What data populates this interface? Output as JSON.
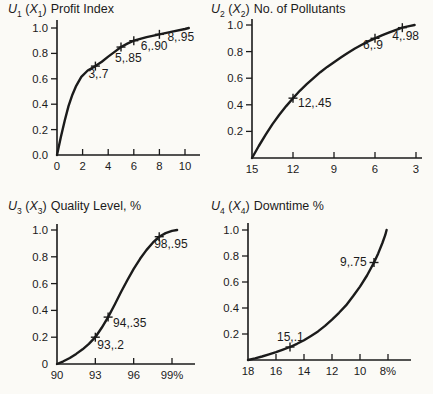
{
  "figure_title": "Utility functions for four attributes",
  "chart_data": [
    {
      "id": "u1",
      "type": "line",
      "title": {
        "func": "U",
        "func_sub": "1",
        "lparen": "(",
        "arg": "X",
        "arg_sub": "1",
        "rparen": ")",
        "label": "Profit Index"
      },
      "x_range": [
        0,
        10
      ],
      "y_range": [
        0,
        1
      ],
      "x_ticks": [
        0,
        2,
        4,
        6,
        8,
        10
      ],
      "x_tick_labels": [
        "0",
        "2",
        "4",
        "6",
        "8",
        "10"
      ],
      "y_ticks": [
        0,
        0.2,
        0.4,
        0.6,
        0.8,
        1.0
      ],
      "y_tick_labels": [
        "0.0",
        "0.2",
        "0.4",
        "0.6",
        "0.8",
        "1.0"
      ],
      "curve": [
        [
          0,
          0
        ],
        [
          0.3,
          0.14
        ],
        [
          0.6,
          0.27
        ],
        [
          0.9,
          0.385
        ],
        [
          1.2,
          0.475
        ],
        [
          1.5,
          0.545
        ],
        [
          1.9,
          0.615
        ],
        [
          2.4,
          0.665
        ],
        [
          3,
          0.7
        ],
        [
          3.5,
          0.735
        ],
        [
          4,
          0.775
        ],
        [
          4.5,
          0.812
        ],
        [
          5,
          0.85
        ],
        [
          5.5,
          0.877
        ],
        [
          6,
          0.9
        ],
        [
          7,
          0.928
        ],
        [
          8,
          0.95
        ],
        [
          9,
          0.972
        ],
        [
          10,
          0.992
        ],
        [
          10.3,
          1.0
        ]
      ],
      "points": [
        {
          "x": 3,
          "y": 0.7,
          "label": "3,.7",
          "dx": -7,
          "dy": 12
        },
        {
          "x": 5,
          "y": 0.85,
          "label": "5,.85",
          "dx": -6,
          "dy": 15
        },
        {
          "x": 6,
          "y": 0.9,
          "label": "6,.90",
          "dx": 7,
          "dy": 9
        },
        {
          "x": 8,
          "y": 0.95,
          "label": "8,.95",
          "dx": 8,
          "dy": 7
        }
      ]
    },
    {
      "id": "u2",
      "type": "line",
      "title": {
        "func": "U",
        "func_sub": "2",
        "lparen": "(",
        "arg": "X",
        "arg_sub": "2",
        "rparen": ")",
        "label": "No. of Pollutants"
      },
      "x_range": [
        15,
        3
      ],
      "y_range": [
        0,
        1
      ],
      "x_ticks": [
        15,
        12,
        9,
        6,
        3
      ],
      "x_tick_labels": [
        "15",
        "12",
        "9",
        "6",
        "3"
      ],
      "y_ticks": [
        0.2,
        0.4,
        0.6,
        0.8,
        1.0
      ],
      "y_tick_labels": [
        "0.2",
        "0.4",
        "0.6",
        "0.8",
        "1.0"
      ],
      "curve": [
        [
          15,
          0
        ],
        [
          14.5,
          0.09
        ],
        [
          14,
          0.175
        ],
        [
          13.5,
          0.255
        ],
        [
          13,
          0.325
        ],
        [
          12.5,
          0.39
        ],
        [
          12,
          0.45
        ],
        [
          11.5,
          0.505
        ],
        [
          11,
          0.555
        ],
        [
          10.5,
          0.6
        ],
        [
          10,
          0.645
        ],
        [
          9.5,
          0.685
        ],
        [
          9,
          0.72
        ],
        [
          8.5,
          0.755
        ],
        [
          8,
          0.79
        ],
        [
          7.5,
          0.822
        ],
        [
          7,
          0.85
        ],
        [
          6.5,
          0.877
        ],
        [
          6,
          0.9
        ],
        [
          5.5,
          0.922
        ],
        [
          5,
          0.942
        ],
        [
          4.5,
          0.962
        ],
        [
          4,
          0.98
        ],
        [
          3.5,
          0.992
        ],
        [
          3.1,
          1.0
        ]
      ],
      "points": [
        {
          "x": 12,
          "y": 0.45,
          "label": "12,.45",
          "dx": 5,
          "dy": 9
        },
        {
          "x": 6,
          "y": 0.9,
          "label": "6,.9",
          "dx": -12,
          "dy": 11
        },
        {
          "x": 4,
          "y": 0.98,
          "label": "4,.98",
          "dx": -10,
          "dy": 12
        }
      ]
    },
    {
      "id": "u3",
      "type": "line",
      "title": {
        "func": "U",
        "func_sub": "3",
        "lparen": "(",
        "arg": "X",
        "arg_sub": "3",
        "rparen": ")",
        "label": "Quality Level, %"
      },
      "x_range": [
        90,
        99
      ],
      "y_range": [
        0,
        1
      ],
      "x_ticks": [
        90,
        93,
        96,
        99
      ],
      "x_tick_labels": [
        "90",
        "93",
        "96",
        "99%"
      ],
      "y_ticks": [
        0,
        0.2,
        0.4,
        0.6,
        0.8,
        1.0
      ],
      "y_tick_labels": [
        "0",
        "0.2",
        "0.4",
        "0.6",
        "0.8",
        "1.0"
      ],
      "curve": [
        [
          90,
          0
        ],
        [
          90.5,
          0.02
        ],
        [
          91,
          0.045
        ],
        [
          91.5,
          0.075
        ],
        [
          92,
          0.11
        ],
        [
          92.5,
          0.15
        ],
        [
          93,
          0.2
        ],
        [
          93.5,
          0.27
        ],
        [
          94,
          0.35
        ],
        [
          94.5,
          0.44
        ],
        [
          95,
          0.535
        ],
        [
          95.5,
          0.625
        ],
        [
          96,
          0.71
        ],
        [
          96.5,
          0.785
        ],
        [
          97,
          0.85
        ],
        [
          97.5,
          0.905
        ],
        [
          98,
          0.95
        ],
        [
          98.5,
          0.977
        ],
        [
          99,
          0.993
        ],
        [
          99.4,
          1.0
        ]
      ],
      "points": [
        {
          "x": 93,
          "y": 0.2,
          "label": "93,.2",
          "dx": 2,
          "dy": 12
        },
        {
          "x": 94,
          "y": 0.35,
          "label": "94,.35",
          "dx": 5,
          "dy": 10
        },
        {
          "x": 98,
          "y": 0.95,
          "label": "98,.95",
          "dx": -5,
          "dy": 11
        }
      ]
    },
    {
      "id": "u4",
      "type": "line",
      "title": {
        "func": "U",
        "func_sub": "4",
        "lparen": "(",
        "arg": "X",
        "arg_sub": "4",
        "rparen": ")",
        "label": "Downtime %"
      },
      "x_range": [
        18,
        8
      ],
      "y_range": [
        0,
        1
      ],
      "x_ticks": [
        18,
        16,
        14,
        12,
        10,
        8
      ],
      "x_tick_labels": [
        "18",
        "16",
        "14",
        "12",
        "10",
        "8%"
      ],
      "y_ticks": [
        0.2,
        0.4,
        0.6,
        0.8,
        1.0
      ],
      "y_tick_labels": [
        "0.2",
        "0.4",
        "0.6",
        "0.8",
        "1.0"
      ],
      "curve": [
        [
          18,
          0
        ],
        [
          17.5,
          0.012
        ],
        [
          17,
          0.027
        ],
        [
          16.5,
          0.043
        ],
        [
          16,
          0.06
        ],
        [
          15.5,
          0.08
        ],
        [
          15,
          0.1
        ],
        [
          14.5,
          0.125
        ],
        [
          14,
          0.152
        ],
        [
          13.5,
          0.185
        ],
        [
          13,
          0.22
        ],
        [
          12.5,
          0.262
        ],
        [
          12,
          0.31
        ],
        [
          11.5,
          0.363
        ],
        [
          11,
          0.42
        ],
        [
          10.5,
          0.49
        ],
        [
          10,
          0.565
        ],
        [
          9.5,
          0.65
        ],
        [
          9,
          0.75
        ],
        [
          8.7,
          0.82
        ],
        [
          8.4,
          0.9
        ],
        [
          8.2,
          0.96
        ],
        [
          8.1,
          1.0
        ]
      ],
      "points": [
        {
          "x": 15,
          "y": 0.1,
          "label": "15,.1",
          "dx": -13,
          "dy": -6
        },
        {
          "x": 9,
          "y": 0.75,
          "label": "9,.75",
          "dx": -34,
          "dy": 3
        }
      ]
    }
  ]
}
